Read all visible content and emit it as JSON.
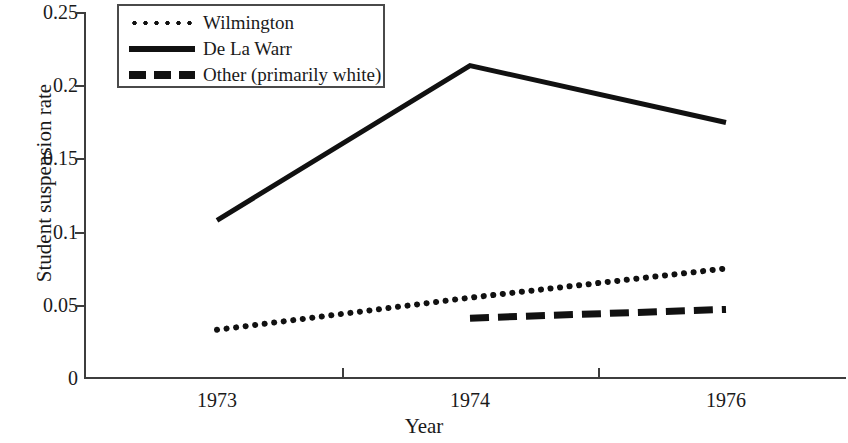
{
  "chart_data": {
    "type": "line",
    "title": "",
    "xlabel": "Year",
    "ylabel": "Student suspension rate",
    "categories": [
      "1973",
      "1974",
      "1976"
    ],
    "x_tick_labels": [
      "1973",
      "1974",
      "1976"
    ],
    "y_tick_labels": [
      "0.25",
      "0.2",
      "0.15",
      "0.1",
      "0.05",
      "0"
    ],
    "y_tick_values": [
      0.25,
      0.2,
      0.15,
      0.1,
      0.05,
      0
    ],
    "ylim": [
      0,
      0.25
    ],
    "grid": false,
    "legend_position": "upper-left-inside",
    "series": [
      {
        "name": "Wilmington",
        "style": "dotted",
        "color": "#111111",
        "x": [
          "1973",
          "1974",
          "1976"
        ],
        "values": [
          0.033,
          0.055,
          0.075
        ]
      },
      {
        "name": "De La Warr",
        "style": "solid",
        "color": "#111111",
        "x": [
          "1973",
          "1974",
          "1976"
        ],
        "values": [
          0.108,
          0.214,
          0.175
        ]
      },
      {
        "name": "Other (primarily white)",
        "style": "dashed",
        "color": "#111111",
        "x": [
          "1974",
          "1976"
        ],
        "values": [
          0.041,
          0.047
        ]
      }
    ]
  },
  "axes": {
    "y_title": "Student suspension rate",
    "x_title": "Year",
    "y_ticks": [
      {
        "label": "0.25"
      },
      {
        "label": "0.2"
      },
      {
        "label": "0.15"
      },
      {
        "label": "0.1"
      },
      {
        "label": "0.05"
      },
      {
        "label": "0"
      }
    ],
    "x_ticks": [
      {
        "label": "1973"
      },
      {
        "label": "1974"
      },
      {
        "label": "1976"
      }
    ]
  },
  "legend": {
    "entries": [
      {
        "label": "Wilmington",
        "style": "dotted"
      },
      {
        "label": "De La Warr",
        "style": "solid"
      },
      {
        "label": "Other (primarily white)",
        "style": "dashed"
      }
    ]
  }
}
